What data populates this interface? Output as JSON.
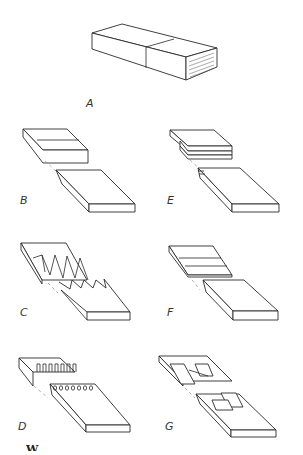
{
  "figure": {
    "type": "wood joint illustration",
    "panels": [
      {
        "id": "A",
        "label": "A",
        "description": "solid timber block with butt seam"
      },
      {
        "id": "B",
        "label": "B",
        "description": "plain scarf joint"
      },
      {
        "id": "C",
        "label": "C",
        "description": "serrated scarf joint"
      },
      {
        "id": "D",
        "label": "D",
        "description": "finger joint"
      },
      {
        "id": "E",
        "label": "E",
        "description": "multiple-layer stepped scarf"
      },
      {
        "id": "F",
        "label": "F",
        "description": "stepped scarf joint"
      },
      {
        "id": "G",
        "label": "G",
        "description": "hooked/keyed scarf joint"
      }
    ],
    "caption_fragment": "W"
  },
  "colors": {
    "background": "#ffffff",
    "ink": "#2a2a2a"
  }
}
